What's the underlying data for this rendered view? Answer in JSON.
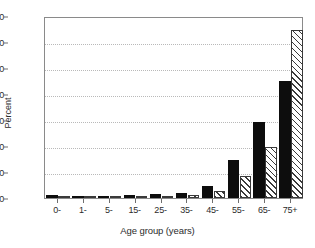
{
  "chart_data": {
    "type": "bar",
    "title": "",
    "subtitle": "",
    "xlabel": "Age group (years)",
    "ylabel": "Percent",
    "categories": [
      "0-",
      "1-",
      "5-",
      "15-",
      "25-",
      "35-",
      "45-",
      "55-",
      "65-",
      "75+"
    ],
    "ylim": [
      0,
      70
    ],
    "yticks": [
      0,
      10,
      20,
      30,
      40,
      50,
      60,
      70
    ],
    "ytick_labels": [
      "0",
      "10",
      "20",
      "30",
      "40",
      "50",
      "60",
      "70"
    ],
    "grid": "horizontal-dotted",
    "legend": "none",
    "series": [
      {
        "name": "solid",
        "style": "solid-black",
        "color": "#0d0d0d",
        "values": [
          1.3,
          0.3,
          0.3,
          1.2,
          1.4,
          1.9,
          4.7,
          14.5,
          29.2,
          45.0
        ]
      },
      {
        "name": "hatched",
        "style": "diagonal-hatch",
        "color": "#3a3a3a",
        "values": [
          0.9,
          0.2,
          0.2,
          0.4,
          0.5,
          1.1,
          2.8,
          8.5,
          19.6,
          64.5
        ]
      }
    ]
  }
}
